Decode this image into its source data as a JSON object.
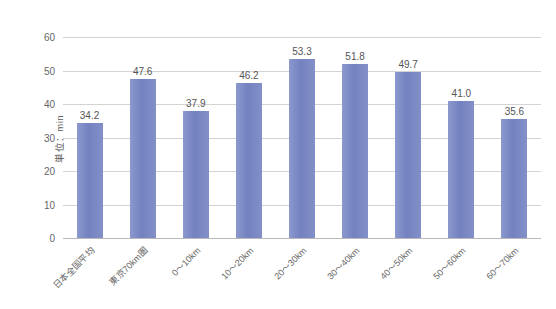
{
  "chart_data": {
    "type": "bar",
    "title": "",
    "subtitle": "",
    "xlabel": "",
    "ylabel": "単位：min",
    "ylim": [
      0,
      60
    ],
    "yticks": [
      0,
      10,
      20,
      30,
      40,
      50,
      60
    ],
    "ytick_labels": [
      "0",
      "10",
      "20",
      "30",
      "40",
      "50",
      "60"
    ],
    "grid": true,
    "legend": "none",
    "bar_color": "#7b8bc6",
    "gridline_color": "#d3d3d3",
    "categories": [
      "日本全国平均",
      "東京70km圏",
      "0～10km",
      "10～20km",
      "20～30km",
      "30～40km",
      "40～50km",
      "50～60km",
      "60～70km"
    ],
    "values": [
      34.2,
      47.6,
      37.9,
      46.2,
      53.3,
      51.8,
      49.7,
      41.0,
      35.6
    ],
    "value_labels": [
      "34.2",
      "47.6",
      "37.9",
      "46.2",
      "53.3",
      "51.8",
      "49.7",
      "41.0",
      "35.6"
    ]
  }
}
